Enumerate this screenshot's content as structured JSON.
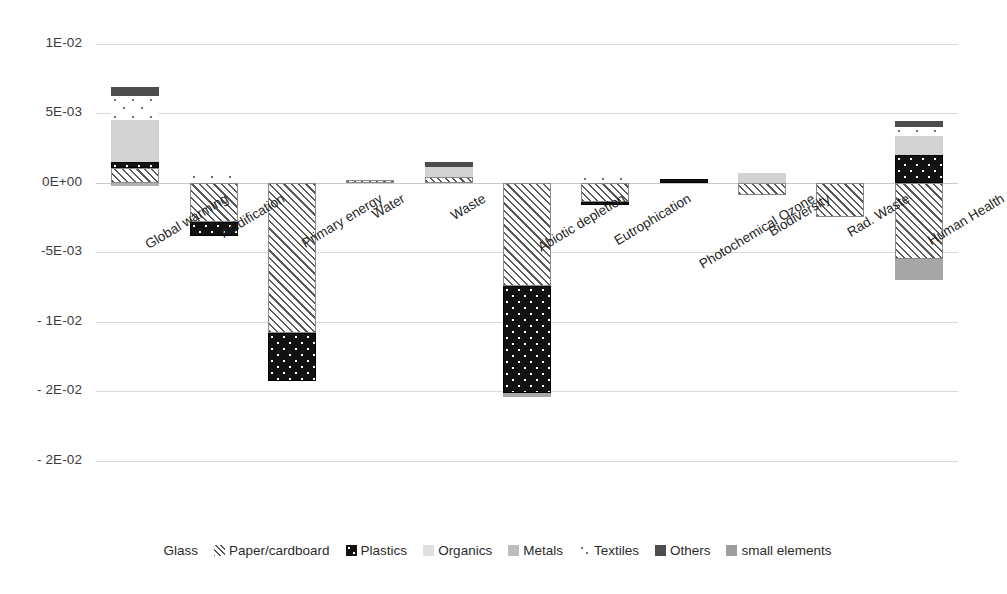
{
  "chart_data": {
    "type": "bar",
    "subtype": "stacked-bar-with-negatives",
    "title": "",
    "xlabel": "",
    "ylabel": "",
    "grid": true,
    "legend_position": "bottom",
    "ylim": [
      -0.025,
      0.011
    ],
    "ytick_labels": [
      "1E-02",
      "5E-03",
      "0E+00",
      "-5E-03",
      "- 1E-02",
      "- 2E-02",
      "- 2E-02"
    ],
    "ytick_values": [
      0.01,
      0.005,
      0,
      -0.005,
      -0.01,
      -0.015,
      -0.02
    ],
    "categories": [
      "Global warming",
      "Acidification",
      "Primary energy",
      "Water",
      "Waste",
      "Abiotic depletion",
      "Eutrophication",
      "Photochemical Ozone",
      "Biodiversity",
      "Rad. Waste",
      "Human Health"
    ],
    "series": [
      {
        "name": "Glass",
        "pattern": "glass",
        "values": [
          0,
          0,
          0,
          0,
          0,
          0,
          0,
          0,
          0,
          0,
          0
        ]
      },
      {
        "name": "Paper/cardboard",
        "pattern": "paper",
        "values": [
          0.00105,
          -0.00282,
          -0.0108,
          0.00022,
          0.00043,
          -0.0074,
          -0.00138,
          0,
          -0.0009,
          -0.0025,
          -0.0055
        ]
      },
      {
        "name": "Plastics",
        "pattern": "plastics",
        "values": [
          0.00043,
          -0.001,
          -0.00345,
          0,
          0,
          -0.00772,
          -0.00024,
          0.00025,
          0,
          0,
          0.002
        ]
      },
      {
        "name": "Organics",
        "pattern": "organics",
        "values": [
          0.00305,
          0,
          0,
          0,
          0.0007,
          0,
          0,
          0,
          0.0007,
          0,
          0.00135
        ]
      },
      {
        "name": "Metals",
        "pattern": "metals",
        "values": [
          0,
          0,
          0,
          0,
          0,
          -0.00034,
          0,
          0,
          0,
          0,
          -0.0015
        ]
      },
      {
        "name": "Textiles",
        "pattern": "textiles",
        "values": [
          0.0017,
          0.0007,
          0,
          0,
          0,
          0,
          0.00055,
          0,
          0,
          0,
          0.00065
        ]
      },
      {
        "name": "Others",
        "pattern": "others",
        "values": [
          0.0007,
          0,
          0,
          0,
          0.0004,
          0,
          0,
          0,
          0,
          0,
          0.00045
        ]
      },
      {
        "name": "small elements",
        "pattern": "small",
        "values": [
          -0.0002,
          0,
          0,
          0,
          0,
          0,
          0,
          0,
          0,
          0,
          0
        ]
      }
    ]
  },
  "legend": {
    "items": [
      {
        "label": "Glass",
        "swatch": "glass-swatch"
      },
      {
        "label": "Paper/cardboard",
        "swatch": "paper-swatch"
      },
      {
        "label": "Plastics",
        "swatch": "plastics-swatch"
      },
      {
        "label": "Organics",
        "swatch": "organics-swatch"
      },
      {
        "label": "Metals",
        "swatch": "metals-swatch"
      },
      {
        "label": "Textiles",
        "swatch": "textiles-swatch"
      },
      {
        "label": "Others",
        "swatch": "others-swatch"
      },
      {
        "label": "small elements",
        "swatch": "small-elements-swatch"
      }
    ]
  },
  "colors": {
    "grid": "#d9d9d9",
    "zero_line": "#c8c8c8",
    "text": "#2b2b2b",
    "plastics": "#121212",
    "organics": "#d2d2d2",
    "metals": "#a6a6a6",
    "others": "#4d4d4d",
    "small_elements": "#b0b0b0"
  }
}
